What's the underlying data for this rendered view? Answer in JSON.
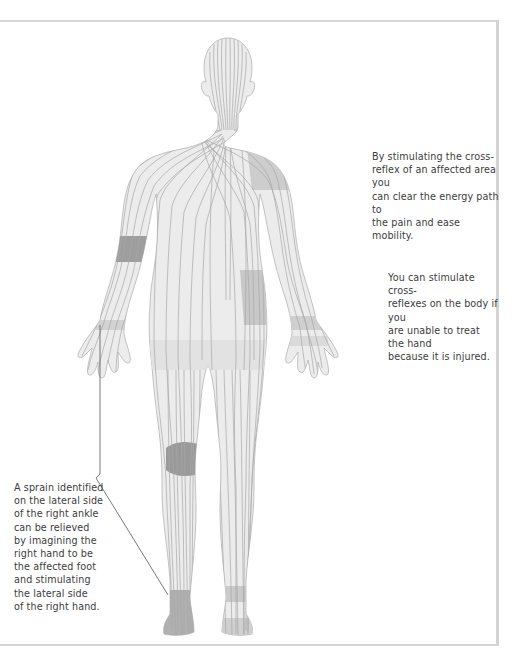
{
  "figure": {
    "colors": {
      "body_fill": "#ececec",
      "body_line": "#a6a6a6",
      "light_zone": "#d9d9d9",
      "medium_zone": "#c4c4c4",
      "dark_zone": "#9a9a9a",
      "frame": "#d4d4d4",
      "text": "#3c3c3c",
      "leader_line": "#555555"
    },
    "zones": [
      {
        "name": "left-shoulder",
        "shade": "medium"
      },
      {
        "name": "right-forearm",
        "shade": "dark"
      },
      {
        "name": "left-hip",
        "shade": "medium"
      },
      {
        "name": "right-knee",
        "shade": "dark"
      },
      {
        "name": "right-wrist",
        "shade": "medium"
      },
      {
        "name": "left-wrist",
        "shade": "medium"
      },
      {
        "name": "right-ankle",
        "shade": "dark"
      },
      {
        "name": "left-ankle",
        "shade": "medium"
      }
    ]
  },
  "captions": {
    "shoulder": "By stimulating the cross-\nreflex of an affected area you\ncan clear the energy path to\nthe pain and ease mobility.",
    "hand": "You can stimulate cross-\nreflexes on the body if you\nare unable to treat the hand\nbecause it is injured.",
    "ankle": "A sprain identified\non the lateral side\nof the right ankle\ncan be relieved\nby imagining the\nright hand to be\nthe affected foot\nand stimulating\nthe lateral side\nof the right hand."
  }
}
